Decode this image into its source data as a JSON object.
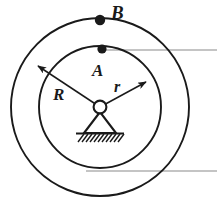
{
  "figure": {
    "background_color": "#ffffff",
    "stroke_color": "#1a1a1a",
    "reference_line_color": "#8a8a8a",
    "labels": {
      "outer_point": "B",
      "inner_point": "A",
      "outer_radius": "R",
      "inner_radius": "r"
    },
    "geometry": {
      "center_x": 100,
      "center_y": 107,
      "outer_radius": 89,
      "inner_radius": 61,
      "hinge_radius": 6,
      "outer_point_x": 100,
      "outer_point_y": 20,
      "inner_point_x": 102,
      "inner_point_y": 49,
      "dot_radius_outer": 5.2,
      "dot_radius_inner": 4.6
    },
    "reference_lines": [
      {
        "name": "upper-reference-line",
        "x1": 100,
        "y1": 50,
        "x2": 217,
        "y2": 50
      },
      {
        "name": "lower-reference-line",
        "x1": 86,
        "y1": 171,
        "x2": 217,
        "y2": 171
      }
    ],
    "radius_arrows": [
      {
        "name": "outer-radius-arrow",
        "from_x": 100,
        "from_y": 107,
        "to_x": 38,
        "to_y": 66,
        "label": "R",
        "label_x": 53,
        "label_y": 99
      },
      {
        "name": "inner-radius-arrow",
        "from_x": 100,
        "from_y": 107,
        "to_x": 146,
        "to_y": 82,
        "label": "r",
        "label_x": 114,
        "label_y": 91
      }
    ],
    "label_positions": {
      "outer_point_label_x": 111,
      "outer_point_label_y": 19,
      "inner_point_label_x": 92,
      "inner_point_label_y": 76
    },
    "support": {
      "name": "pin-support",
      "apex_x": 100,
      "apex_y": 113,
      "base_left_x": 84,
      "base_right_x": 116,
      "base_y": 133,
      "ground_left_x": 78,
      "ground_right_x": 122,
      "ground_y": 133,
      "hatch_count": 11,
      "hatch_depth": 9
    }
  }
}
